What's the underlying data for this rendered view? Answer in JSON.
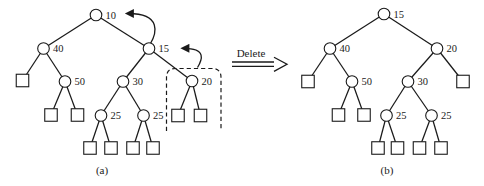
{
  "figure": {
    "caption_a": "(a)",
    "caption_b": "(b)"
  },
  "colors": {
    "ink": "#1a1a1a",
    "background": "#ffffff",
    "node_fill": "#ffffff"
  },
  "operation": {
    "label": "Delete",
    "arrow_lines": [
      [
        232,
        62,
        276,
        62
      ],
      [
        232,
        66.3,
        276,
        66.3
      ]
    ],
    "arrow_head_points": "274,57.2 287,64.2 274,71.4"
  },
  "tree_a": {
    "name": "tree-before-delete",
    "nodes": [
      {
        "label": "10",
        "x": 96,
        "y": 15
      },
      {
        "label": "40",
        "x": 43.5,
        "y": 48.5
      },
      {
        "label": "15",
        "x": 149,
        "y": 48.5
      },
      {
        "type": "external",
        "x": 22.5,
        "y": 80.5
      },
      {
        "label": "50",
        "x": 65,
        "y": 81.5
      },
      {
        "label": "30",
        "x": 123,
        "y": 81.5
      },
      {
        "label": "20",
        "x": 192,
        "y": 81
      },
      {
        "type": "external",
        "x": 51,
        "y": 115
      },
      {
        "type": "external",
        "x": 77.5,
        "y": 115
      },
      {
        "label": "25",
        "x": 101,
        "y": 115.5
      },
      {
        "label": "25",
        "x": 143.5,
        "y": 115.5
      },
      {
        "type": "external",
        "x": 178,
        "y": 115.5
      },
      {
        "type": "external",
        "x": 200.5,
        "y": 115.5
      },
      {
        "type": "external",
        "x": 90,
        "y": 148
      },
      {
        "type": "external",
        "x": 111,
        "y": 148
      },
      {
        "type": "external",
        "x": 133,
        "y": 148
      },
      {
        "type": "external",
        "x": 153,
        "y": 148
      }
    ],
    "edges": [
      [
        0,
        1
      ],
      [
        0,
        2
      ],
      [
        1,
        3
      ],
      [
        1,
        4
      ],
      [
        2,
        5
      ],
      [
        2,
        6
      ],
      [
        4,
        7
      ],
      [
        4,
        8
      ],
      [
        5,
        9
      ],
      [
        5,
        10
      ],
      [
        6,
        11
      ],
      [
        6,
        12
      ],
      [
        9,
        13
      ],
      [
        9,
        14
      ],
      [
        10,
        15
      ],
      [
        10,
        16
      ]
    ],
    "arrows": [
      {
        "name": "rotation-arrow-15-to-10",
        "d": "M 150.5 43.5 C 156 34 162.5 13.5 128.5 13.5"
      },
      {
        "name": "rotation-arrow-20-to-15",
        "d": "M 197.5 67.5 C 202 60 207 48.3 184 48.3"
      }
    ],
    "highlight": {
      "name": "dashed-delete-region",
      "d": "M 166.5 131 L 166.5 77.5 Q 166.5 68.5 175.5 68.5 L 212 68.5 Q 221 68.5 221 77.5 L 221 131"
    }
  },
  "tree_b": {
    "name": "tree-after-delete",
    "nodes": [
      {
        "label": "15",
        "x": 384,
        "y": 14
      },
      {
        "label": "40",
        "x": 330,
        "y": 48.5
      },
      {
        "label": "20",
        "x": 437,
        "y": 48.5
      },
      {
        "type": "external",
        "x": 308,
        "y": 81.5
      },
      {
        "label": "50",
        "x": 352,
        "y": 81.5
      },
      {
        "label": "30",
        "x": 408,
        "y": 81.5
      },
      {
        "type": "external",
        "x": 463,
        "y": 81.5
      },
      {
        "type": "external",
        "x": 338.5,
        "y": 115
      },
      {
        "type": "external",
        "x": 364,
        "y": 115
      },
      {
        "label": "25",
        "x": 386.5,
        "y": 115.5
      },
      {
        "label": "25",
        "x": 431.5,
        "y": 115.5
      },
      {
        "type": "external",
        "x": 378,
        "y": 148
      },
      {
        "type": "external",
        "x": 397.5,
        "y": 148
      },
      {
        "type": "external",
        "x": 419.5,
        "y": 148
      },
      {
        "type": "external",
        "x": 441,
        "y": 148
      }
    ],
    "edges": [
      [
        0,
        1
      ],
      [
        0,
        2
      ],
      [
        1,
        3
      ],
      [
        1,
        4
      ],
      [
        2,
        5
      ],
      [
        2,
        6
      ],
      [
        4,
        7
      ],
      [
        4,
        8
      ],
      [
        5,
        9
      ],
      [
        5,
        10
      ],
      [
        9,
        11
      ],
      [
        9,
        12
      ],
      [
        10,
        13
      ],
      [
        10,
        14
      ]
    ],
    "arrows": [],
    "highlight": null
  }
}
